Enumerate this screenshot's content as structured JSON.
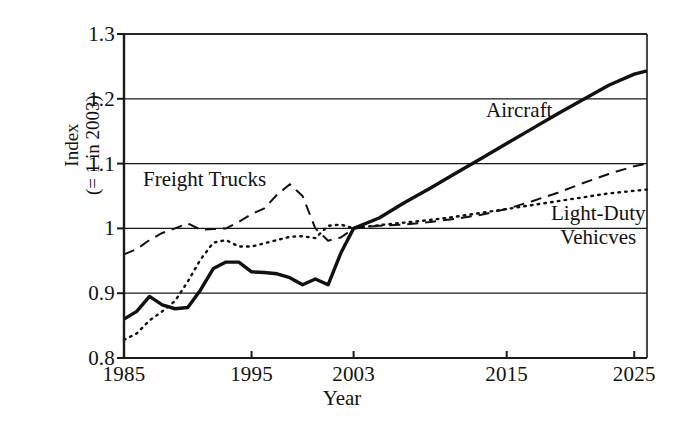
{
  "chart_data": {
    "type": "line",
    "title": "",
    "xlabel": "Year",
    "ylabel": "Index (= 1 in 2003)",
    "ylabel_lines": [
      "Index",
      "(= 1 in 2003)"
    ],
    "xlim": [
      1985,
      2026
    ],
    "ylim": [
      0.8,
      1.3
    ],
    "grid": true,
    "legend_position": "inline-annotations",
    "xticks": [
      1985,
      1995,
      2003,
      2015,
      2025
    ],
    "xtick_labels": [
      "1985",
      "1995",
      "2003",
      "2015",
      "2025"
    ],
    "yticks": [
      0.8,
      0.9,
      1.0,
      1.1,
      1.2,
      1.3
    ],
    "ytick_labels": [
      "0.8",
      "0.9",
      "1",
      "1.1",
      "1.2",
      "1.3"
    ],
    "series": [
      {
        "name": "Aircraft",
        "style": "solid",
        "width": 3.4,
        "color": "#111111",
        "x": [
          1985,
          1986,
          1987,
          1988,
          1989,
          1990,
          1991,
          1992,
          1993,
          1994,
          1995,
          1996,
          1997,
          1998,
          1999,
          2000,
          2001,
          2002,
          2003,
          2005,
          2007,
          2009,
          2011,
          2013,
          2015,
          2017,
          2019,
          2021,
          2023,
          2025,
          2026
        ],
        "y": [
          0.86,
          0.872,
          0.895,
          0.882,
          0.876,
          0.878,
          0.905,
          0.938,
          0.948,
          0.948,
          0.933,
          0.932,
          0.93,
          0.924,
          0.913,
          0.922,
          0.913,
          0.962,
          1.0,
          1.016,
          1.04,
          1.062,
          1.085,
          1.108,
          1.131,
          1.154,
          1.177,
          1.199,
          1.221,
          1.238,
          1.243
        ]
      },
      {
        "name": "Freight Trucks",
        "style": "dashed",
        "width": 2.0,
        "color": "#111111",
        "x": [
          1985,
          1986,
          1987,
          1988,
          1989,
          1990,
          1991,
          1992,
          1993,
          1994,
          1995,
          1996,
          1997,
          1998,
          1999,
          2000,
          2001,
          2002,
          2003,
          2005,
          2007,
          2009,
          2011,
          2013,
          2015,
          2017,
          2019,
          2021,
          2023,
          2025,
          2026
        ],
        "y": [
          0.96,
          0.968,
          0.982,
          0.993,
          1.0,
          1.008,
          0.998,
          0.999,
          1.0,
          1.01,
          1.022,
          1.031,
          1.052,
          1.068,
          1.05,
          1.0,
          0.981,
          0.986,
          1.0,
          1.004,
          1.006,
          1.01,
          1.015,
          1.021,
          1.03,
          1.042,
          1.055,
          1.07,
          1.084,
          1.096,
          1.1
        ]
      },
      {
        "name": "Light-Duty Vehicves",
        "style": "dotted",
        "width": 2.4,
        "color": "#111111",
        "x": [
          1985,
          1986,
          1987,
          1988,
          1989,
          1990,
          1991,
          1992,
          1993,
          1994,
          1995,
          1996,
          1997,
          1998,
          1999,
          2000,
          2001,
          2002,
          2003,
          2005,
          2007,
          2009,
          2011,
          2013,
          2015,
          2017,
          2019,
          2021,
          2023,
          2025,
          2026
        ],
        "y": [
          0.828,
          0.838,
          0.858,
          0.872,
          0.888,
          0.918,
          0.952,
          0.978,
          0.982,
          0.972,
          0.972,
          0.977,
          0.982,
          0.987,
          0.988,
          0.985,
          1.004,
          1.006,
          1.0,
          1.005,
          1.009,
          1.013,
          1.018,
          1.024,
          1.03,
          1.036,
          1.042,
          1.048,
          1.054,
          1.058,
          1.06
        ]
      }
    ],
    "annotations": [
      {
        "text": "Aircraft",
        "series": "Aircraft",
        "x": 2012,
        "y": 1.178
      },
      {
        "text": "Freight Trucks",
        "series": "Freight Trucks",
        "x": 1988,
        "y": 1.068
      },
      {
        "text": "Light-Duty",
        "series": "Light-Duty Vehicves",
        "x": 2020,
        "y": 1.012
      },
      {
        "text": "Vehicves",
        "series": "Light-Duty Vehicves",
        "x": 2020,
        "y": 0.985
      }
    ]
  }
}
